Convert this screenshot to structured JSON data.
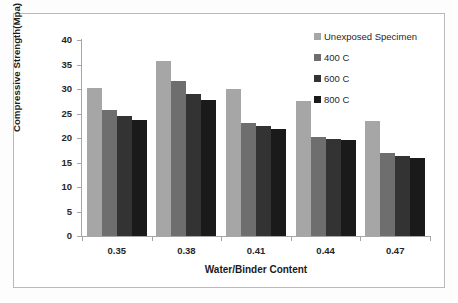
{
  "chart_data": {
    "type": "bar",
    "title": "",
    "xlabel": "Water/Binder Content",
    "ylabel": "Compressive Strength(Mpa)",
    "categories": [
      "0.35",
      "0.38",
      "0.41",
      "0.44",
      "0.47"
    ],
    "series": [
      {
        "name": "Unexposed Specimen",
        "color": "#a6a6a6",
        "values": [
          30.2,
          35.7,
          30.0,
          27.6,
          23.4
        ]
      },
      {
        "name": "400 C",
        "color": "#6e6e6e",
        "values": [
          25.7,
          31.6,
          23.1,
          20.3,
          16.9
        ]
      },
      {
        "name": "600 C",
        "color": "#333333",
        "values": [
          24.4,
          28.9,
          22.4,
          19.8,
          16.4
        ]
      },
      {
        "name": "800 C",
        "color": "#1a1a1a",
        "values": [
          23.6,
          27.7,
          21.8,
          19.5,
          16.0
        ]
      }
    ],
    "ylim": [
      0,
      40
    ],
    "ytick_step": 5,
    "yticks": [
      "40",
      "35",
      "30",
      "25",
      "20",
      "15",
      "10",
      "5",
      "0"
    ],
    "grid": false,
    "legend_position": "top-right",
    "axis_color": "#a6a6a6",
    "frame_color": "#b9b9b9",
    "plot_background": "#ffffff"
  }
}
